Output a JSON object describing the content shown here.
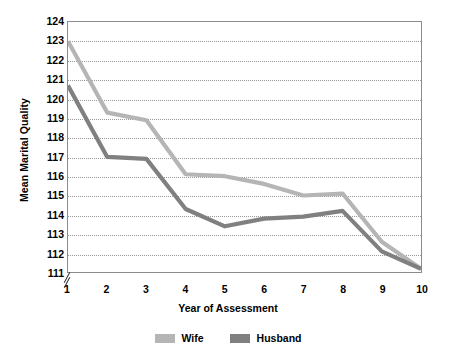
{
  "chart_data": {
    "type": "line",
    "title": "",
    "xlabel": "Year of Assessment",
    "ylabel": "Mean Marital Quality",
    "x": [
      1,
      2,
      3,
      4,
      5,
      6,
      7,
      8,
      9,
      10
    ],
    "xlim": [
      1,
      10
    ],
    "ylim": [
      111,
      124
    ],
    "yticks": [
      111,
      112,
      113,
      114,
      115,
      116,
      117,
      118,
      119,
      120,
      121,
      122,
      123,
      124
    ],
    "xticks": [
      "1",
      "2",
      "3",
      "4",
      "5",
      "6",
      "7",
      "8",
      "9",
      "10"
    ],
    "grid": true,
    "axis_break": true,
    "legend_position": "bottom",
    "series": [
      {
        "name": "Wife",
        "color": "#b5b5b5",
        "values": [
          123.0,
          119.3,
          118.9,
          116.1,
          116.0,
          115.6,
          115.0,
          115.1,
          112.6,
          111.2
        ]
      },
      {
        "name": "Husband",
        "color": "#808080",
        "values": [
          120.7,
          117.0,
          116.9,
          114.3,
          113.4,
          113.8,
          113.9,
          114.2,
          112.1,
          111.2
        ]
      }
    ]
  },
  "legend": {
    "items": [
      {
        "label": "Wife",
        "color": "#b5b5b5"
      },
      {
        "label": "Husband",
        "color": "#808080"
      }
    ]
  },
  "axes": {
    "y_title": "Mean Marital Quality",
    "x_title": "Year of Assessment"
  }
}
